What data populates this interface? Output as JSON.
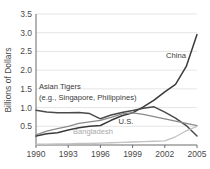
{
  "chart_data": {
    "type": "line",
    "title": "",
    "xlabel": "",
    "ylabel": "Billions of Dollars",
    "x": [
      1990,
      1991,
      1992,
      1993,
      1994,
      1995,
      1996,
      1997,
      1998,
      1999,
      2000,
      2001,
      2002,
      2003,
      2004,
      2005
    ],
    "xlim": [
      1990,
      2005
    ],
    "ylim": [
      0,
      3.5
    ],
    "xticks": [
      "1990",
      "1993",
      "1996",
      "1999",
      "2002",
      "2005"
    ],
    "xtick_values": [
      1990,
      1993,
      1996,
      1999,
      2002,
      2005
    ],
    "yticks": [
      "0.5",
      "1.0",
      "1.5",
      "2.0",
      "2.5",
      "3.0",
      "3.5"
    ],
    "ytick_values": [
      0.5,
      1.0,
      1.5,
      2.0,
      2.5,
      3.0,
      3.5
    ],
    "grid": true,
    "legend": "inline-annotations",
    "series": [
      {
        "name": "China",
        "color": "#3a3a3a",
        "width": 1.5,
        "values": [
          0.24,
          0.3,
          0.33,
          0.4,
          0.46,
          0.5,
          0.52,
          0.66,
          0.78,
          0.86,
          1.02,
          1.2,
          1.42,
          1.62,
          2.1,
          2.95
        ]
      },
      {
        "name": "Asian Tigers",
        "color": "#4a4a4a",
        "width": 1.5,
        "values": [
          0.93,
          0.88,
          0.86,
          0.86,
          0.87,
          0.84,
          0.7,
          0.8,
          0.87,
          0.92,
          0.98,
          1.02,
          0.88,
          0.72,
          0.52,
          0.24
        ]
      },
      {
        "name": "U.S.",
        "color": "#8a8a8a",
        "width": 1.3,
        "values": [
          0.27,
          0.37,
          0.44,
          0.5,
          0.58,
          0.62,
          0.66,
          0.74,
          0.83,
          0.86,
          0.82,
          0.76,
          0.7,
          0.64,
          0.58,
          0.52
        ]
      },
      {
        "name": "Bangladesh",
        "color": "#c2c2c2",
        "width": 1.3,
        "values": [
          0.02,
          0.02,
          0.03,
          0.03,
          0.04,
          0.04,
          0.05,
          0.06,
          0.07,
          0.08,
          0.09,
          0.1,
          0.11,
          0.22,
          0.38,
          0.5
        ]
      }
    ],
    "annotations": [
      {
        "name": "china-label",
        "text": "China",
        "x": 176,
        "y": 58,
        "style": "dark",
        "anchor": "middle"
      },
      {
        "name": "asian-tigers-label-line1",
        "text": "Asian Tigers",
        "x": 39,
        "y": 89,
        "style": "dark",
        "anchor": "start"
      },
      {
        "name": "asian-tigers-label-line2",
        "text": "(e.g., Singapore, Philippines)",
        "x": 39,
        "y": 100,
        "style": "dark",
        "anchor": "start"
      },
      {
        "name": "us-label",
        "text": "U.S.",
        "x": 126,
        "y": 124,
        "style": "dark",
        "anchor": "middle"
      },
      {
        "name": "bangladesh-label",
        "text": "Bangladesh",
        "x": 93,
        "y": 134,
        "style": "light",
        "anchor": "middle"
      }
    ]
  },
  "plot_geometry": {
    "left": 36,
    "right": 197,
    "top": 14,
    "bottom": 145
  }
}
